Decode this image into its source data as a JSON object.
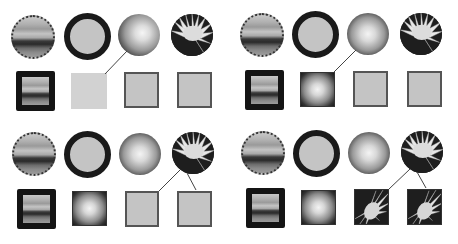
{
  "diagram": {
    "swatches": [
      {
        "id": "stripes",
        "label": "striped-texture",
        "shape": "circle",
        "border": "dotted"
      },
      {
        "id": "gray",
        "label": "plain-gray",
        "shape": "circle",
        "border": "thick-ring"
      },
      {
        "id": "radial",
        "label": "radial-gradient",
        "shape": "circle",
        "border": "none"
      },
      {
        "id": "flower",
        "label": "flower-photo",
        "shape": "circle",
        "border": "none"
      }
    ],
    "panels": [
      {
        "position": "top-left",
        "targets": [
          "stripes",
          "lightgray",
          "gray",
          "gray"
        ],
        "connections": [
          {
            "from": "radial",
            "to": 2
          }
        ]
      },
      {
        "position": "top-right",
        "targets": [
          "stripes",
          "radial",
          "gray",
          "gray"
        ],
        "connections": [
          {
            "from": "radial",
            "to": 2
          }
        ]
      },
      {
        "position": "bottom-left",
        "targets": [
          "stripes",
          "radial",
          "gray",
          "gray"
        ],
        "connections": [
          {
            "from": "flower",
            "to": 3
          },
          {
            "from": "flower",
            "to": 4
          }
        ]
      },
      {
        "position": "bottom-right",
        "targets": [
          "stripes",
          "radial",
          "flower",
          "flower"
        ],
        "connections": [
          {
            "from": "flower",
            "to": 3
          },
          {
            "from": "flower",
            "to": 4
          }
        ]
      }
    ],
    "colors": {
      "line": "#444444",
      "border_dark": "#1a1a1a",
      "fill_gray": "#c4c4c4",
      "fill_lightgray": "#d2d2d2"
    }
  }
}
